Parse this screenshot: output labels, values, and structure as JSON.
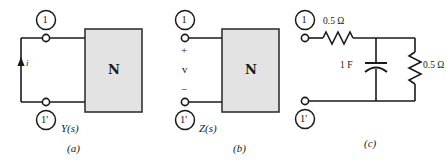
{
  "figure": {
    "background_color": "#ffffff",
    "line_color": "#1a1a1a",
    "box_fill_color": "#e3e3e3",
    "box_stroke_color": "#333333"
  },
  "panels": [
    {
      "id": "a",
      "caption": "(a)",
      "function_label": "Y(s)",
      "network_symbol": "Α",
      "network_symbol_text": "N",
      "terminal_top_label": "1",
      "terminal_bottom_label": "1'",
      "current_label": "i",
      "current_direction": "up"
    },
    {
      "id": "b",
      "caption": "(b)",
      "function_label": "Z(s)",
      "network_symbol_text": "N",
      "terminal_top_label": "1",
      "terminal_bottom_label": "1'",
      "polarity_plus": "+",
      "polarity_minus": "−",
      "voltage_label": "v"
    },
    {
      "id": "c",
      "caption": "(c)",
      "terminal_top_label": "1",
      "terminal_bottom_label": "1'",
      "components": [
        {
          "name": "series-resistor",
          "value": "0.5 Ω",
          "type": "resistor"
        },
        {
          "name": "shunt-capacitor",
          "value": "1 F",
          "type": "capacitor"
        },
        {
          "name": "shunt-resistor",
          "value": "0.5 Ω",
          "type": "resistor"
        }
      ]
    }
  ]
}
